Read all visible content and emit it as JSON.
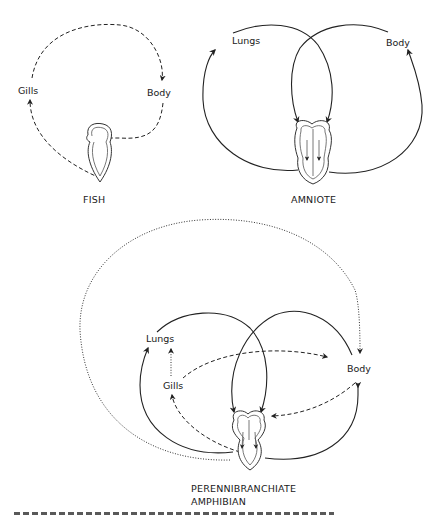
{
  "diagrams": {
    "fish": {
      "title": "FISH",
      "labels": {
        "gills": "Gills",
        "body": "Body"
      }
    },
    "amniote": {
      "title": "AMNIOTE",
      "labels": {
        "lungs": "Lungs",
        "body": "Body"
      }
    },
    "amphibian": {
      "title_line1": "PERENNIBRANCHIATE",
      "title_line2": "AMPHIBIAN",
      "labels": {
        "lungs": "Lungs",
        "gills": "Gills",
        "body": "Body"
      }
    }
  },
  "line_styles": {
    "solid": "circulation path",
    "dashed": "gill / body path",
    "dotted": "alternate path"
  },
  "colors": {
    "ink": "#222222",
    "background": "#ffffff"
  }
}
